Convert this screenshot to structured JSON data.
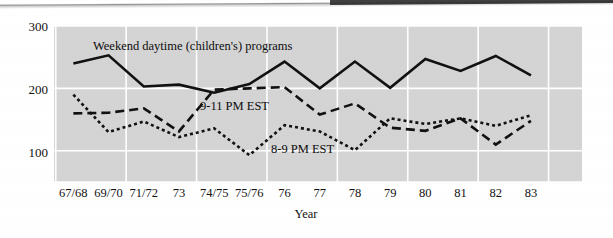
{
  "chart_data": {
    "type": "line",
    "title": "",
    "xlabel": "Year",
    "ylabel": "",
    "grid": true,
    "legend_position": "inline-annotations",
    "plot_background": "#d4d4d4",
    "gridline_color": "#ffffff",
    "ylim": [
      50,
      300
    ],
    "yticks": [
      100,
      200,
      300
    ],
    "ytick_labels": [
      "100",
      "200",
      "300"
    ],
    "categories": [
      "67/68",
      "69/70",
      "71/72",
      "73",
      "74/75",
      "75/76",
      "76",
      "77",
      "78",
      "79",
      "80",
      "81",
      "82",
      "83"
    ],
    "series": [
      {
        "name": "Weekend daytime (children's) programs",
        "style": "solid",
        "color": "#111111",
        "values": [
          240,
          253,
          203,
          206,
          193,
          207,
          243,
          200,
          243,
          201,
          247,
          228,
          252,
          221
        ]
      },
      {
        "name": "9-11 PM EST",
        "style": "dashed",
        "color": "#111111",
        "values": [
          160,
          161,
          168,
          131,
          198,
          200,
          202,
          158,
          176,
          137,
          132,
          152,
          110,
          148
        ]
      },
      {
        "name": "8-9 PM EST",
        "style": "dotted",
        "color": "#111111",
        "values": [
          190,
          130,
          147,
          122,
          136,
          93,
          141,
          131,
          101,
          152,
          143,
          152,
          140,
          157
        ]
      }
    ],
    "annotations": [
      {
        "text": "Weekend daytime (children's) programs",
        "x": 93,
        "y": 50
      },
      {
        "text": "9-11 PM EST",
        "x": 200,
        "y": 110
      },
      {
        "text": "8-9 PM EST",
        "x": 271,
        "y": 153
      }
    ]
  },
  "axis": {
    "x_title": "Year",
    "y_tick_300": "300",
    "y_tick_200": "200",
    "y_tick_100": "100",
    "x_ticks": [
      "67/68",
      "69/70",
      "71/72",
      "73",
      "74/75",
      "75/76",
      "76",
      "77",
      "78",
      "79",
      "80",
      "81",
      "82",
      "83"
    ]
  },
  "ghost_text": {
    "left": "",
    "right": ""
  }
}
